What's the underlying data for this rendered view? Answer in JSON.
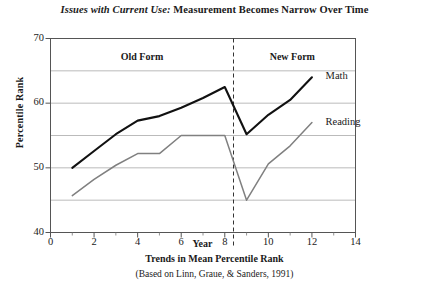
{
  "chart_data": {
    "type": "line",
    "title_italic": "Issues with Current Use:",
    "title_rest": " Measurement Becomes Narrow Over Time",
    "title": "Issues with Current Use: Measurement Becomes Narrow Over Time",
    "caption_line1": "Trends in Mean Percentile Rank",
    "caption_line2": "(Based on Linn, Graue, & Sanders, 1991)",
    "xlabel": "Year",
    "ylabel": "Percentile Rank",
    "xlim": [
      0,
      14
    ],
    "ylim": [
      40,
      70
    ],
    "xticks": [
      0,
      2,
      4,
      6,
      8,
      10,
      12,
      14
    ],
    "xticklabels": [
      "0",
      "2",
      "4",
      "6",
      "8",
      "10",
      "12",
      "14"
    ],
    "xminorticks": [
      1,
      3,
      5,
      7,
      9,
      11,
      13
    ],
    "yticks": [
      40,
      50,
      60,
      70
    ],
    "yticklabels": [
      "40",
      "50",
      "60",
      "70"
    ],
    "gridlines": [
      45,
      50,
      55,
      60,
      65
    ],
    "grid": true,
    "legend_position": "inline-right",
    "annotations": [
      {
        "text": "Old Form",
        "x": 4.2,
        "y": 67.2
      },
      {
        "text": "New Form",
        "x": 11.1,
        "y": 67.2
      }
    ],
    "divider": {
      "x": 8.4,
      "style": "dashed",
      "color": "#333333"
    },
    "series": [
      {
        "name": "Math",
        "color": "#111111",
        "label_x": 12.35,
        "label_y": 64.0,
        "x": [
          1,
          2,
          3,
          4,
          5,
          6,
          7,
          8,
          9,
          10,
          11,
          12
        ],
        "y": [
          50.0,
          52.6,
          55.2,
          57.3,
          58.0,
          59.3,
          60.8,
          62.5,
          55.2,
          58.2,
          60.5,
          64.0
        ]
      },
      {
        "name": "Reading",
        "color": "#808080",
        "label_x": 12.35,
        "label_y": 57.0,
        "x": [
          1,
          2,
          3,
          4,
          5,
          6,
          7,
          8,
          9,
          10,
          11,
          12
        ],
        "y": [
          45.7,
          48.2,
          50.4,
          52.2,
          52.2,
          55.0,
          55.0,
          55.0,
          45.0,
          50.6,
          53.4,
          57.0
        ]
      }
    ]
  }
}
